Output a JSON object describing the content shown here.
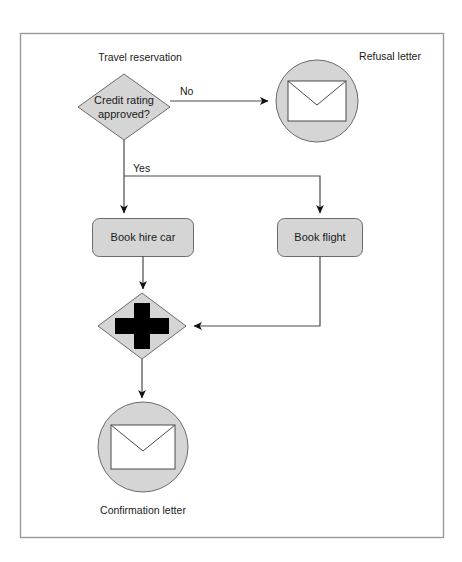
{
  "diagram": {
    "type": "flowchart",
    "frame": {
      "x": 20,
      "y": 33,
      "width": 423,
      "height": 504,
      "border_color": "#9a9a9a",
      "background_color": "#ffffff"
    },
    "theme": {
      "shape_fill": "#d5d5d5",
      "shape_stroke": "#6b6b6b",
      "connector_color": "#4a4a4a",
      "text_color": "#1a1a1a",
      "envelope_fill": "#ffffff"
    },
    "nodes": [
      {
        "id": "start-label",
        "kind": "caption",
        "label": "Travel reservation",
        "x": 140,
        "y": 57
      },
      {
        "id": "credit-decision",
        "kind": "decision-diamond",
        "label_line1": "Credit rating",
        "label_line2": "approved?",
        "cx": 124,
        "cy": 107,
        "rx": 46,
        "ry": 33
      },
      {
        "id": "refusal-letter",
        "kind": "message-circle",
        "label": "Refusal letter",
        "cx": 317,
        "cy": 101,
        "r": 41,
        "label_x": 390,
        "label_y": 61
      },
      {
        "id": "book-hire-car",
        "kind": "task-box",
        "label": "Book hire car",
        "x": 92,
        "y": 218,
        "width": 101,
        "height": 38
      },
      {
        "id": "book-flight",
        "kind": "task-box",
        "label": "Book flight",
        "x": 277,
        "y": 218,
        "width": 85,
        "height": 38
      },
      {
        "id": "merge-gateway",
        "kind": "parallel-gateway-diamond",
        "label": "+",
        "cx": 142,
        "cy": 326,
        "rx": 44,
        "ry": 33
      },
      {
        "id": "confirmation-letter",
        "kind": "message-circle",
        "label": "Confirmation letter",
        "cx": 143,
        "cy": 447,
        "r": 45,
        "label_x": 143,
        "label_y": 511
      }
    ],
    "edges": [
      {
        "id": "edge-decision-no",
        "from": "credit-decision",
        "to": "refusal-letter",
        "label": "No",
        "label_x": 180,
        "label_y": 91
      },
      {
        "id": "edge-decision-yes",
        "from": "credit-decision",
        "to": "book-hire-car",
        "label": "Yes",
        "label_x": 147,
        "label_y": 170
      },
      {
        "id": "edge-yes-branch-flight",
        "from": "credit-decision",
        "to": "book-flight",
        "label": ""
      },
      {
        "id": "edge-hire-car-merge",
        "from": "book-hire-car",
        "to": "merge-gateway",
        "label": ""
      },
      {
        "id": "edge-flight-merge",
        "from": "book-flight",
        "to": "merge-gateway",
        "label": ""
      },
      {
        "id": "edge-merge-confirmation",
        "from": "merge-gateway",
        "to": "confirmation-letter",
        "label": ""
      }
    ]
  }
}
